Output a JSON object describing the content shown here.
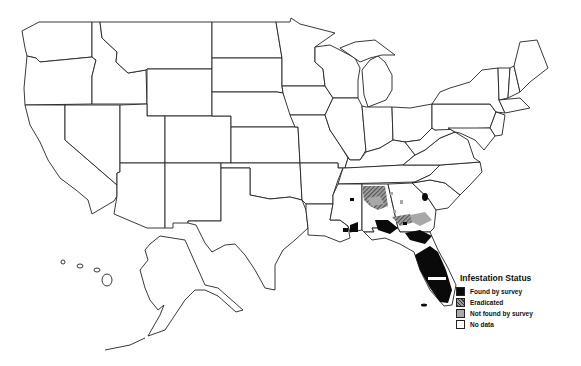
{
  "map": {
    "region": "United States",
    "legend": {
      "title": "Infestation Status",
      "items": [
        {
          "label": "Found by survey",
          "key": "found",
          "color": "#0a0a0a"
        },
        {
          "label": "Eradicated",
          "key": "eradicated",
          "color": "#555555"
        },
        {
          "label": "Not found by survey",
          "key": "not_found",
          "color": "#a8a8a8"
        },
        {
          "label": "No data",
          "key": "no_data",
          "color": "#ffffff"
        }
      ]
    }
  }
}
